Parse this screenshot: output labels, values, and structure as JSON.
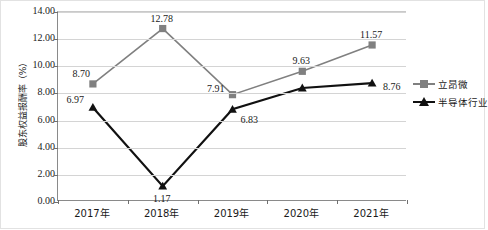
{
  "chart_data": {
    "type": "line",
    "title": "",
    "xlabel": "",
    "ylabel": "股东权益报酬率（%）",
    "categories": [
      "2017年",
      "2018年",
      "2019年",
      "2020年",
      "2021年"
    ],
    "ylim": [
      0,
      14
    ],
    "ytick_step": 2,
    "ytick_labels": [
      "14.00",
      "12.00",
      "10.00",
      "8.00",
      "6.00",
      "4.00",
      "2.00",
      "0.00"
    ],
    "ytick_values": [
      14,
      12,
      10,
      8,
      6,
      4,
      2,
      0
    ],
    "grid": true,
    "legend_position": "right",
    "series": [
      {
        "name": "立昂微",
        "marker": "square",
        "color": "#808080",
        "values": [
          8.7,
          12.78,
          7.91,
          9.63,
          11.57
        ],
        "labels": [
          "8.70",
          "12.78",
          "7.91",
          "9.63",
          "11.57"
        ]
      },
      {
        "name": "半导体行业",
        "marker": "triangle",
        "color": "#111111",
        "values": [
          6.97,
          1.17,
          6.83,
          8.4,
          8.76
        ],
        "labels": [
          "6.97",
          "1.17",
          "6.83",
          "",
          "8.76"
        ]
      }
    ]
  },
  "axis": {
    "y_title": "股东权益报酬率（%）"
  },
  "legend": {
    "items": [
      {
        "label": "立昂微"
      },
      {
        "label": "半导体行业"
      }
    ]
  }
}
